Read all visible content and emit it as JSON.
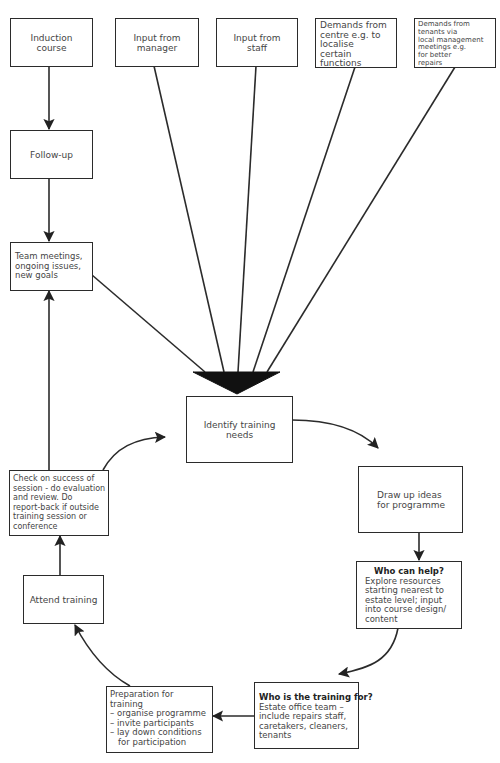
{
  "diagram": {
    "title_visible": "",
    "boxes": {
      "induction": {
        "lines": [
          "Induction",
          "course"
        ]
      },
      "manager": {
        "lines": [
          "Input from",
          "manager"
        ]
      },
      "staff": {
        "lines": [
          "Input from",
          "staff"
        ]
      },
      "centre": {
        "lines": [
          "Demands from",
          "centre e.g. to",
          "localise",
          "certain",
          "functions"
        ]
      },
      "tenants": {
        "lines": [
          "Demands from",
          "tenants via",
          "local management",
          "meetings e.g.",
          "for better",
          "repairs"
        ]
      },
      "followup": {
        "lines": [
          "Follow-up"
        ]
      },
      "team": {
        "lines": [
          "Team meetings,",
          "ongoing issues,",
          "new goals"
        ]
      },
      "identify": {
        "lines": [
          "Identify training",
          "needs"
        ]
      },
      "check": {
        "lines": [
          "Check on success of",
          "session - do evaluation",
          "and review. Do",
          "report-back if outside",
          "training session or",
          "conference"
        ]
      },
      "draw": {
        "lines": [
          "Draw up ideas",
          "for programme"
        ]
      },
      "whohelp": {
        "heading": "Who can help?",
        "lines": [
          "Explore resources",
          "starting nearest to",
          "estate level; input",
          "into course design/",
          "content"
        ]
      },
      "attend": {
        "lines": [
          "Attend training"
        ]
      },
      "preparation": {
        "lines": [
          "Preparation for",
          "training",
          "– organise programme",
          "– invite participants",
          "– lay down conditions",
          "   for participation"
        ]
      },
      "whofor": {
        "heading": "Who is the training for?",
        "lines": [
          "Estate office team –",
          "include repairs staff,",
          "caretakers, cleaners,",
          "tenants"
        ]
      }
    },
    "flow": [
      {
        "from": "Induction course",
        "to": "Follow-up"
      },
      {
        "from": "Follow-up",
        "to": "Team meetings, ongoing issues, new goals"
      },
      {
        "from": "Team meetings, ongoing issues, new goals",
        "to": "Identify training needs"
      },
      {
        "from": "Input from manager",
        "to": "Identify training needs"
      },
      {
        "from": "Input from staff",
        "to": "Identify training needs"
      },
      {
        "from": "Demands from centre",
        "to": "Identify training needs"
      },
      {
        "from": "Demands from tenants",
        "to": "Identify training needs"
      },
      {
        "from": "Identify training needs",
        "to": "Draw up ideas for programme"
      },
      {
        "from": "Draw up ideas for programme",
        "to": "Who can help?"
      },
      {
        "from": "Who can help?",
        "to": "Who is the training for?"
      },
      {
        "from": "Who is the training for?",
        "to": "Preparation for training"
      },
      {
        "from": "Preparation for training",
        "to": "Attend training"
      },
      {
        "from": "Attend training",
        "to": "Check on success of session"
      },
      {
        "from": "Check on success of session",
        "to": "Identify training needs"
      },
      {
        "from": "Check on success of session",
        "to": "Team meetings, ongoing issues, new goals"
      }
    ],
    "colors": {
      "line": "#2b2b2b",
      "text": "#454545",
      "background": "#ffffff"
    }
  }
}
